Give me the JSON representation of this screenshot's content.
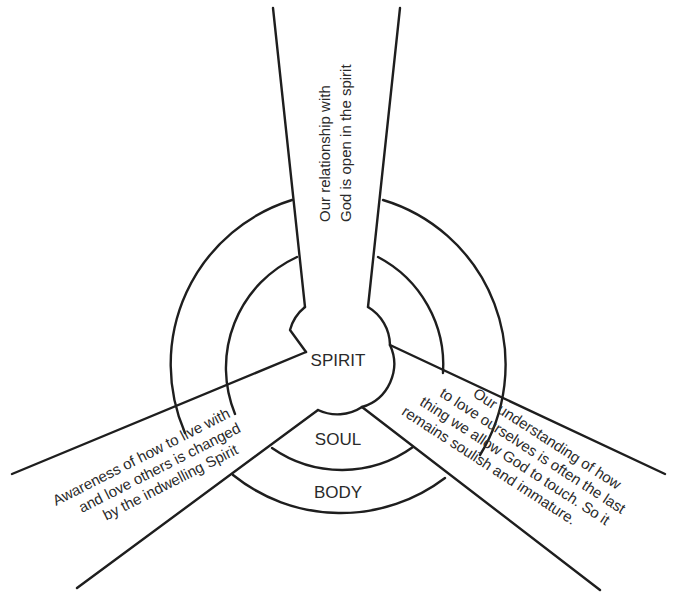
{
  "diagram": {
    "center_labels": {
      "spirit": "SPIRIT",
      "soul": "SOUL",
      "body": "BODY"
    },
    "beams": {
      "top": {
        "lines": [
          "Our relationship with",
          "God is open in the spirit"
        ]
      },
      "left": {
        "lines": [
          "Awareness of how to live with",
          "and love others is changed",
          "by the indwelling Spirit"
        ]
      },
      "right": {
        "lines": [
          "Our understanding of how",
          "to love ourselves is often the last",
          "thing we allow God to touch. So it",
          "remains soulish and immature."
        ]
      }
    },
    "colors": {
      "line": "#1e1e1e",
      "text": "#2a2a2a",
      "background": "#ffffff"
    }
  }
}
